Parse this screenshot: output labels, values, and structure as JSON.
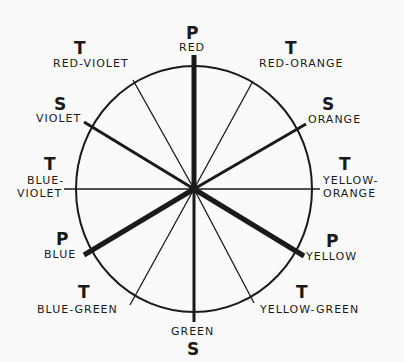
{
  "diagram": {
    "type": "color-wheel",
    "center": {
      "x": 194,
      "y": 189
    },
    "radius_x": 118,
    "radius_y": 123,
    "line_color": "#1a1a1a",
    "background": "#fafafa",
    "legend": {
      "P": "Primary",
      "S": "Secondary",
      "T": "Tertiary"
    },
    "colors": [
      {
        "name": "RED",
        "class": "P",
        "angle": 90
      },
      {
        "name": "RED-ORANGE",
        "class": "T",
        "angle": 60
      },
      {
        "name": "ORANGE",
        "class": "S",
        "angle": 30
      },
      {
        "name": "YELLOW-ORANGE",
        "class": "T",
        "angle": 0
      },
      {
        "name": "YELLOW",
        "class": "P",
        "angle": -30
      },
      {
        "name": "YELLOW-GREEN",
        "class": "T",
        "angle": -60
      },
      {
        "name": "GREEN",
        "class": "S",
        "angle": -90
      },
      {
        "name": "BLUE-GREEN",
        "class": "T",
        "angle": -120
      },
      {
        "name": "BLUE",
        "class": "P",
        "angle": -150
      },
      {
        "name": "BLUE-VIOLET",
        "class": "T",
        "angle": 180
      },
      {
        "name": "VIOLET",
        "class": "S",
        "angle": 150
      },
      {
        "name": "RED-VIOLET",
        "class": "T",
        "angle": 120
      }
    ]
  },
  "labels": {
    "red": {
      "cls": "P",
      "text": "RED"
    },
    "red_orange": {
      "cls": "T",
      "text": "RED-ORANGE"
    },
    "orange": {
      "cls": "S",
      "text": "ORANGE"
    },
    "yellow_orange": {
      "cls": "T",
      "line1": "YELLOW-",
      "line2": "ORANGE"
    },
    "yellow": {
      "cls": "P",
      "text": "YELLOW"
    },
    "yellow_green": {
      "cls": "T",
      "text": "YELLOW-GREEN"
    },
    "green": {
      "cls": "S",
      "text": "GREEN"
    },
    "blue_green": {
      "cls": "T",
      "text": "BLUE-GREEN"
    },
    "blue": {
      "cls": "P",
      "text": "BLUE"
    },
    "blue_violet": {
      "cls": "T",
      "line1": "BLUE-",
      "line2": "VIOLET"
    },
    "violet": {
      "cls": "S",
      "text": "VIOLET"
    },
    "red_violet": {
      "cls": "T",
      "text": "RED-VIOLET"
    }
  }
}
